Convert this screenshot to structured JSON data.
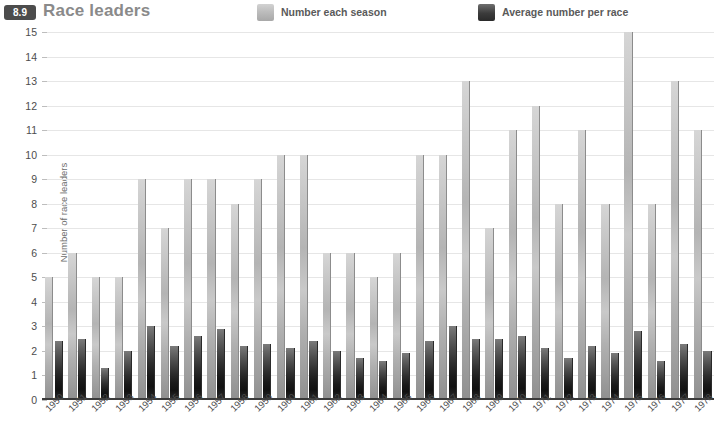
{
  "header": {
    "badge": "8.9",
    "title": "Race leaders"
  },
  "legend": {
    "items": [
      {
        "label": "Number each season",
        "swatch": "light-grey-gradient-swatch",
        "color": "#bdbdbd"
      },
      {
        "label": "Average number per race",
        "swatch": "dark-grey-gradient-swatch",
        "color": "#2e2e2e"
      }
    ]
  },
  "chart_data": {
    "type": "bar",
    "title": "Race leaders",
    "xlabel": "",
    "ylabel": "Number of race leaders",
    "ylim": [
      0,
      15
    ],
    "yticks": [
      0,
      1,
      2,
      3,
      4,
      5,
      6,
      7,
      8,
      9,
      10,
      11,
      12,
      13,
      14,
      15
    ],
    "grid": true,
    "legend_position": "top",
    "categories": [
      "1950",
      "1951",
      "1952",
      "1953",
      "1954",
      "1955",
      "1956",
      "1957",
      "1958",
      "1959",
      "1960",
      "1961",
      "1962",
      "1963",
      "1964",
      "1965",
      "1966",
      "1967",
      "1968",
      "1969",
      "1970",
      "1971",
      "1972",
      "1973",
      "1974",
      "1975",
      "1976",
      "1977",
      "1978"
    ],
    "series": [
      {
        "name": "Number each season",
        "color": "#bdbdbd",
        "values": [
          5,
          6,
          5,
          5,
          9,
          7,
          9,
          9,
          8,
          9,
          10,
          10,
          6,
          6,
          5,
          6,
          10,
          10,
          13,
          7,
          11,
          12,
          8,
          11,
          8,
          15,
          8,
          13,
          11
        ]
      },
      {
        "name": "Average number per race",
        "color": "#2e2e2e",
        "values": [
          2.4,
          2.5,
          1.3,
          2.0,
          3.0,
          2.2,
          2.6,
          2.9,
          2.2,
          2.3,
          2.1,
          2.4,
          2.0,
          1.7,
          1.6,
          1.9,
          2.4,
          3.0,
          2.5,
          2.5,
          2.6,
          2.1,
          1.7,
          2.2,
          1.9,
          2.8,
          1.6,
          2.3,
          2.0
        ]
      }
    ]
  }
}
